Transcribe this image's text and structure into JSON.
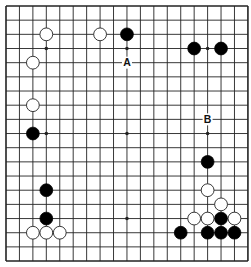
{
  "board": {
    "size": 19,
    "origin_x": 6,
    "origin_y": 6,
    "spacing_x": 13.44,
    "spacing_y": 14.17,
    "line_color": "#222222",
    "background": "#ffffff",
    "stone_radius": 6.4
  },
  "star_points": [
    [
      3,
      3
    ],
    [
      9,
      3
    ],
    [
      15,
      3
    ],
    [
      3,
      9
    ],
    [
      9,
      9
    ],
    [
      15,
      9
    ],
    [
      3,
      15
    ],
    [
      9,
      15
    ],
    [
      15,
      15
    ]
  ],
  "stones": {
    "black": [
      [
        9,
        2
      ],
      [
        14,
        3
      ],
      [
        16,
        3
      ],
      [
        2,
        9
      ],
      [
        15,
        11
      ],
      [
        3,
        13
      ],
      [
        3,
        15
      ],
      [
        16,
        15
      ],
      [
        13,
        16
      ],
      [
        15,
        16
      ],
      [
        16,
        16
      ],
      [
        17,
        16
      ]
    ],
    "white": [
      [
        3,
        2
      ],
      [
        7,
        2
      ],
      [
        2,
        4
      ],
      [
        2,
        7
      ],
      [
        15,
        13
      ],
      [
        16,
        14
      ],
      [
        14,
        15
      ],
      [
        15,
        15
      ],
      [
        17,
        15
      ],
      [
        2,
        16
      ],
      [
        3,
        16
      ],
      [
        4,
        16
      ]
    ]
  },
  "labels": [
    {
      "text": "A",
      "col": 9,
      "row": 4
    },
    {
      "text": "B",
      "col": 15,
      "row": 8
    }
  ],
  "colors": {
    "black_stone": "#000000",
    "white_stone": "#ffffff",
    "stone_outline": "#222222",
    "label": "#111111"
  }
}
